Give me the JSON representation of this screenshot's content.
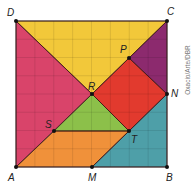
{
  "diagram": {
    "type": "tangram-square",
    "grid_divisions": 8,
    "credit": "Oxacio/Arte/DBR",
    "points": [
      {
        "name": "D",
        "x": 16,
        "y": 21
      },
      {
        "name": "C",
        "x": 167,
        "y": 21
      },
      {
        "name": "A",
        "x": 16,
        "y": 167
      },
      {
        "name": "B",
        "x": 167,
        "y": 167
      },
      {
        "name": "P",
        "x": 129,
        "y": 58
      },
      {
        "name": "R",
        "x": 92,
        "y": 94
      },
      {
        "name": "N",
        "x": 167,
        "y": 94
      },
      {
        "name": "S",
        "x": 54,
        "y": 131
      },
      {
        "name": "T",
        "x": 129,
        "y": 131
      },
      {
        "name": "M",
        "x": 92,
        "y": 167
      }
    ],
    "pieces": [
      {
        "name": "yellow-triangle",
        "color": "#f2c83a",
        "vertices": [
          "D",
          "C",
          "R"
        ]
      },
      {
        "name": "pink-triangle",
        "color": "#d9446a",
        "vertices": [
          "D",
          "R",
          "A"
        ]
      },
      {
        "name": "purple-triangle",
        "color": "#8c2a6e",
        "vertices": [
          "C",
          "N",
          "P"
        ]
      },
      {
        "name": "red-square",
        "color": "#e23a2e",
        "vertices": [
          "P",
          "N",
          "T",
          "R"
        ]
      },
      {
        "name": "green-triangle",
        "color": "#8cc04a",
        "vertices": [
          "R",
          "T",
          "S"
        ]
      },
      {
        "name": "orange-parallelogram",
        "color": "#f0913a",
        "vertices": [
          "S",
          "T",
          "M",
          "A"
        ]
      },
      {
        "name": "teal-triangle",
        "color": "#4e9fa8",
        "vertices": [
          "N",
          "B",
          "M"
        ]
      }
    ],
    "labels": {
      "D": "D",
      "C": "C",
      "A": "A",
      "B": "B",
      "P": "P",
      "R": "R",
      "N": "N",
      "S": "S",
      "T": "T",
      "M": "M"
    }
  }
}
